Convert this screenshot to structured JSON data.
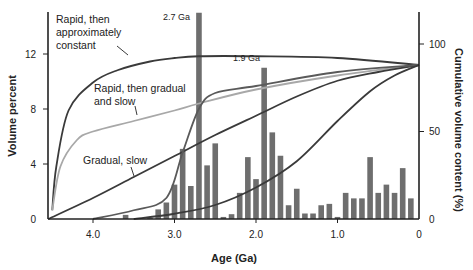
{
  "chart_data": {
    "type": "bar",
    "title": "",
    "xlabel": "Age (Ga)",
    "ylabel": "Volume percent",
    "y2label": "Cumulative volume content (%)",
    "xlim": [
      4.55,
      0
    ],
    "ylim": [
      0,
      14.5
    ],
    "y2lim": [
      0,
      100
    ],
    "x_ticks": [
      "4.0",
      "3.0",
      "2.0",
      "1.0",
      "0"
    ],
    "x_tick_values": [
      4.0,
      3.0,
      2.0,
      1.0,
      0
    ],
    "y_ticks": [
      "0",
      "4",
      "8",
      "12"
    ],
    "y_tick_values": [
      0,
      4,
      8,
      12
    ],
    "y2_ticks": [
      "0",
      "50",
      "100"
    ],
    "y2_tick_values": [
      0,
      50,
      100
    ],
    "grid": false,
    "annotations": [
      {
        "text": "2.7 Ga",
        "x": 2.7
      },
      {
        "text": "1.9 Ga",
        "x": 1.9
      }
    ],
    "bars": {
      "name": "Volume percent",
      "ages": [
        3.6,
        3.3,
        3.2,
        3.1,
        3.0,
        2.9,
        2.8,
        2.7,
        2.6,
        2.5,
        2.4,
        2.3,
        2.2,
        2.1,
        2.0,
        1.9,
        1.8,
        1.7,
        1.6,
        1.5,
        1.4,
        1.3,
        1.2,
        1.1,
        1.0,
        0.9,
        0.8,
        0.7,
        0.6,
        0.5,
        0.4,
        0.3,
        0.2,
        0.1
      ],
      "values": [
        0.3,
        0.1,
        0.7,
        1.2,
        2.5,
        5.1,
        2.4,
        15.0,
        3.9,
        5.5,
        0.15,
        0.35,
        1.9,
        4.5,
        2.9,
        11.0,
        6.3,
        4.6,
        1.0,
        2.2,
        0.4,
        0.4,
        1.0,
        1.1,
        0.15,
        1.9,
        1.5,
        1.5,
        4.5,
        1.9,
        2.5,
        1.9,
        3.7,
        1.5
      ]
    },
    "series": [
      {
        "name": "Rapid, then approximately constant",
        "axis": "y2",
        "x": [
          4.5,
          4.45,
          4.3,
          4.0,
          3.7,
          3.3,
          3.0,
          2.7,
          2.0,
          1.0,
          0
        ],
        "values": [
          5,
          30,
          62,
          78,
          85,
          90,
          92,
          93,
          93,
          92,
          88
        ]
      },
      {
        "name": "Rapid, then gradual and slow",
        "axis": "y2",
        "x": [
          4.5,
          4.4,
          4.2,
          4.0,
          3.5,
          3.0,
          2.7,
          2.0,
          1.0,
          0
        ],
        "values": [
          5,
          30,
          45,
          50,
          56,
          62,
          66,
          74,
          82,
          88
        ]
      },
      {
        "name": "Gradual, slow",
        "axis": "y2",
        "x": [
          4.55,
          4.0,
          3.5,
          3.0,
          2.5,
          2.0,
          1.5,
          1.0,
          0.5,
          0
        ],
        "values": [
          0,
          12,
          24,
          36,
          48,
          59,
          70,
          79,
          84,
          88
        ]
      },
      {
        "name": "Sigmoid (unlabeled, via 2.7 Ga)",
        "axis": "y2",
        "x": [
          4.0,
          3.5,
          3.1,
          2.9,
          2.7,
          2.5,
          2.0,
          1.0,
          0
        ],
        "values": [
          0,
          5,
          12,
          38,
          63,
          72,
          76,
          84,
          88
        ]
      },
      {
        "name": "Late increase (unlabeled)",
        "axis": "y2",
        "x": [
          3.5,
          3.0,
          2.5,
          2.0,
          1.5,
          1.0,
          0.6,
          0.3,
          0
        ],
        "values": [
          0,
          3,
          8,
          18,
          33,
          56,
          73,
          82,
          88
        ]
      }
    ],
    "legend_position": "inline labels"
  },
  "labels": {
    "rapid_constant_l1": "Rapid, then",
    "rapid_constant_l2": "approximately",
    "rapid_constant_l3": "constant",
    "rapid_gradual_l1": "Rapid, then gradual",
    "rapid_gradual_l2": "and slow",
    "gradual_slow": "Gradual, slow",
    "ann_27": "2.7 Ga",
    "ann_19": "1.9 Ga",
    "xlabel": "Age (Ga)",
    "ylabel": "Volume percent",
    "y2label": "Cumulative volume content (%)"
  },
  "colors": {
    "bar": "#6e6e6e",
    "curve_dark": "#3a3a3a",
    "curve_light": "#a8a8a8",
    "curve_mid": "#5a5a5a",
    "axis": "#222222",
    "text": "#222222"
  }
}
